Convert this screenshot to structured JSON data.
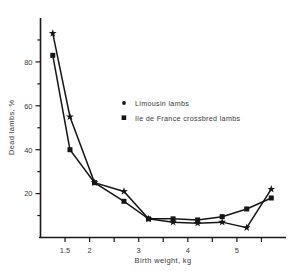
{
  "chart_data": {
    "type": "line",
    "title": "",
    "xlabel": "Birth weight, kg",
    "ylabel": "Dead lambs, %",
    "xlim": [
      1.0,
      6.0
    ],
    "ylim": [
      0,
      100
    ],
    "xticks_labeled": [
      "1.5",
      "2",
      "3",
      "4",
      "5"
    ],
    "xtick_values": [
      1.5,
      2,
      3,
      4,
      5
    ],
    "xticks_minor": [
      1.5,
      2.0,
      2.5,
      3.0,
      3.5,
      4.0,
      4.5,
      5.0,
      5.5
    ],
    "yticks_labeled": [
      "20",
      "40",
      "60",
      "80"
    ],
    "ytick_values": [
      20,
      40,
      60,
      80
    ],
    "yticks_minor": [
      10,
      20,
      30,
      40,
      50,
      60,
      70,
      80,
      90
    ],
    "grid": false,
    "legend_position": "upper-center",
    "series": [
      {
        "name": "Limousin lambs",
        "marker": "star",
        "x": [
          1.25,
          1.6,
          2.1,
          2.7,
          3.2,
          3.7,
          4.2,
          4.7,
          5.2,
          5.7
        ],
        "y": [
          93,
          55,
          25,
          21,
          8.5,
          7,
          6.5,
          7,
          4.5,
          22
        ]
      },
      {
        "name": "Ile de France crossbred lambs",
        "marker": "square",
        "x": [
          1.25,
          1.6,
          2.1,
          2.7,
          3.2,
          3.7,
          4.2,
          4.7,
          5.2,
          5.7
        ],
        "y": [
          83,
          40,
          25,
          16.5,
          8.5,
          8.5,
          8,
          9.5,
          13,
          18
        ]
      }
    ]
  },
  "legend": {
    "items": [
      {
        "label": "Limousin lambs",
        "marker": "dot"
      },
      {
        "label": "Ile de France crossbred lambs",
        "marker": "square"
      }
    ]
  },
  "axes": {
    "x_title": "Birth weight, kg",
    "y_title": "Dead lambs, %"
  },
  "colors": {
    "ink": "#151515",
    "background": "#ffffff",
    "text": "#3a3a3a"
  }
}
